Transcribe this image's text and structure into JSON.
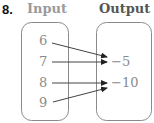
{
  "problem": {
    "number": "8.",
    "input_header": "Input",
    "output_header": "Output"
  },
  "colors": {
    "input_header": "#9a9a9a",
    "output_header": "#555555",
    "values": "#8a8a8a",
    "box_stroke": "#8a8a8a",
    "arrow": "#222222"
  },
  "inputs": [
    "6",
    "7",
    "8",
    "9"
  ],
  "outputs": [
    "−5",
    "−10"
  ],
  "mapping": [
    {
      "from": "6",
      "to": "−5"
    },
    {
      "from": "7",
      "to": "−5"
    },
    {
      "from": "8",
      "to": "−10"
    },
    {
      "from": "9",
      "to": "−10"
    }
  ]
}
